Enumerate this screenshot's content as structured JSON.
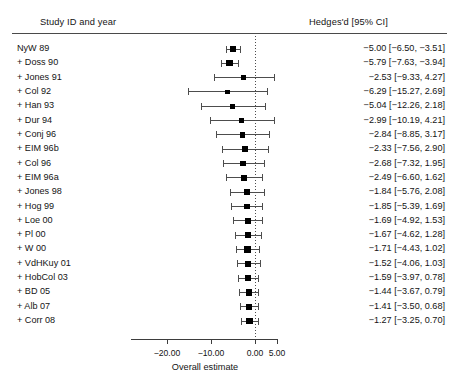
{
  "header": {
    "study_col": "Study ID and year",
    "effect_col": "Hedges'd [95% CI]"
  },
  "axis": {
    "title": "Overall estimate",
    "ticks": [
      "−20.00",
      "−10.00",
      "0.00",
      "5.00"
    ],
    "tick_values": [
      -20,
      -10,
      0,
      5
    ],
    "zero_reference": 0
  },
  "chart_data": {
    "type": "forest",
    "title": "",
    "xlabel": "Overall estimate",
    "ylabel": "",
    "xlim": [
      -20,
      5
    ],
    "grid": false,
    "legend": "none",
    "zero_line": 0,
    "effect_measure": "Hedges'd [95% CI]",
    "categories": [
      "NyW 89",
      "+ Doss 90",
      "+ Jones 91",
      "+ Col 92",
      "+ Han 93",
      "+ Dur 94",
      "+ Conj 96",
      "+ EIM 96b",
      "+ Col 96",
      "+ EIM 96a",
      "+ Jones 98",
      "+ Hog 99",
      "+ Loe 00",
      "+ Pl 00",
      "+ W 00",
      "+ VdHKuy 01",
      "+ HobCol 03",
      "+ BD 05",
      "+ Alb 07",
      "+ Corr 08"
    ],
    "estimates": [
      -5.0,
      -5.79,
      -2.53,
      -6.29,
      -5.04,
      -2.99,
      -2.84,
      -2.33,
      -2.68,
      -2.49,
      -1.84,
      -1.85,
      -1.69,
      -1.67,
      -1.71,
      -1.52,
      -1.59,
      -1.44,
      -1.41,
      -1.27
    ],
    "ci_lower": [
      -6.5,
      -7.63,
      -9.33,
      -15.27,
      -12.26,
      -10.19,
      -8.85,
      -7.56,
      -7.32,
      -6.6,
      -5.76,
      -5.39,
      -4.92,
      -4.62,
      -4.43,
      -4.06,
      -3.97,
      -3.67,
      -3.5,
      -3.25
    ],
    "ci_upper": [
      -3.51,
      -3.94,
      4.27,
      2.69,
      2.18,
      4.21,
      3.17,
      2.9,
      1.95,
      1.62,
      2.08,
      1.69,
      1.53,
      1.28,
      1.02,
      1.03,
      0.78,
      0.79,
      0.68,
      0.7
    ],
    "labels": [
      "−5.00 [−6.50, −3.51]",
      "−5.79 [−7.63, −3.94]",
      "−2.53 [−9.33, 4.27]",
      "−6.29 [−15.27, 2.69]",
      "−5.04 [−12.26, 2.18]",
      "−2.99 [−10.19, 4.21]",
      "−2.84 [−8.85, 3.17]",
      "−2.33 [−7.56, 2.90]",
      "−2.68 [−7.32, 1.95]",
      "−2.49 [−6.60, 1.62]",
      "−1.84 [−5.76, 2.08]",
      "−1.85 [−5.39, 1.69]",
      "−1.69 [−4.92, 1.53]",
      "−1.67 [−4.62, 1.28]",
      "−1.71 [−4.43, 1.02]",
      "−1.52 [−4.06, 1.03]",
      "−1.59 [−3.97, 0.78]",
      "−1.44 [−3.67, 0.79]",
      "−1.41 [−3.50, 0.68]",
      "−1.27 [−3.25, 0.70]"
    ]
  },
  "colors": {
    "marker": "#000000",
    "whisker": "#4d4d4d",
    "rule": "#4a4a4a",
    "text": "#141414",
    "background": "#ffffff"
  }
}
